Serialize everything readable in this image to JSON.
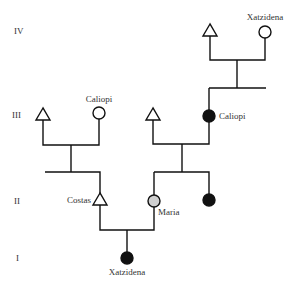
{
  "diagram": {
    "type": "pedigree",
    "generations": [
      {
        "label": "IV",
        "y": 33
      },
      {
        "label": "III",
        "y": 117
      },
      {
        "label": "II",
        "y": 203
      },
      {
        "label": "I",
        "y": 260
      }
    ],
    "individuals": [
      {
        "id": "gen4-male",
        "name": "",
        "sex": "male",
        "status": "unaffected",
        "generation": "IV"
      },
      {
        "id": "gen4-xatzidena",
        "name": "Xatzidena",
        "sex": "female",
        "status": "unaffected",
        "generation": "IV"
      },
      {
        "id": "gen3-left-male",
        "name": "",
        "sex": "male",
        "status": "unaffected",
        "generation": "III"
      },
      {
        "id": "gen3-caliopi-left",
        "name": "Caliopi",
        "sex": "female",
        "status": "unaffected",
        "generation": "III"
      },
      {
        "id": "gen3-mid-male",
        "name": "",
        "sex": "male",
        "status": "unaffected",
        "generation": "III"
      },
      {
        "id": "gen3-caliopi-right",
        "name": "Caliopi",
        "sex": "female",
        "status": "affected",
        "generation": "III"
      },
      {
        "id": "gen2-costas",
        "name": "Costas",
        "sex": "male",
        "status": "unaffected",
        "generation": "II"
      },
      {
        "id": "gen2-maria",
        "name": "Maria",
        "sex": "female",
        "status": "carrier",
        "generation": "II"
      },
      {
        "id": "gen2-sister",
        "name": "",
        "sex": "female",
        "status": "affected",
        "generation": "II"
      },
      {
        "id": "gen1-xatzidena",
        "name": "Xatzidena",
        "sex": "female",
        "status": "affected",
        "generation": "I"
      }
    ],
    "colors": {
      "affected": "#111111",
      "carrier": "#cfcfcf",
      "unaffected": "#ffffff",
      "line": "#111111",
      "text": "#333333"
    }
  }
}
